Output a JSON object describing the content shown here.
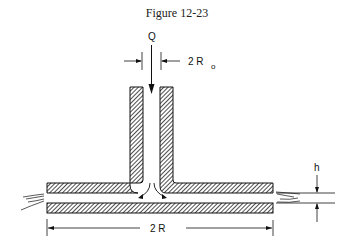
{
  "figure": {
    "title": "Figure 12-23",
    "labels": {
      "flow": "Q",
      "inlet_diameter": "2 R",
      "inlet_diameter_sub": "o",
      "plate_diameter": "2 R",
      "gap": "h"
    }
  },
  "colors": {
    "ink": "#1a1a1a",
    "background": "#ffffff"
  }
}
